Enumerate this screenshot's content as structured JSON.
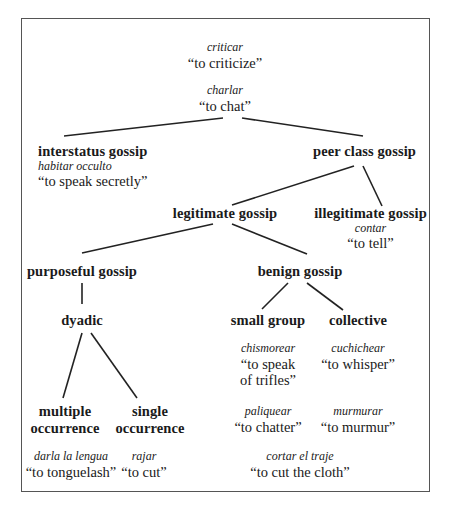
{
  "diagram": {
    "type": "tree",
    "title": "",
    "root_terms": [
      {
        "term": "criticar",
        "gloss": "“to criticize”"
      },
      {
        "term": "charlar",
        "gloss": "“to chat”"
      }
    ],
    "nodes": {
      "interstatus": {
        "label": "interstatus gossip",
        "term": "habitar occulto",
        "gloss": "“to speak secretly”"
      },
      "peer_class": {
        "label": "peer class gossip"
      },
      "legitimate": {
        "label": "legitimate gossip"
      },
      "illegitimate": {
        "label": "illegitimate gossip",
        "term": "contar",
        "gloss": "“to tell”"
      },
      "purposeful": {
        "label": "purposeful gossip"
      },
      "benign": {
        "label": "benign gossip"
      },
      "dyadic": {
        "label": "dyadic"
      },
      "small_group": {
        "label": "small group"
      },
      "collective": {
        "label": "collective"
      },
      "multiple": {
        "label_line1": "multiple",
        "label_line2": "occurrence"
      },
      "single": {
        "label_line1": "single",
        "label_line2": "occurrence"
      }
    },
    "terms": {
      "multiple": {
        "term": "darla la lengua",
        "gloss": "“to tonguelash”"
      },
      "single": {
        "term": "rajar",
        "gloss": "“to cut”"
      },
      "small_group_1": {
        "term": "chismorear",
        "gloss_line1": "“to speak",
        "gloss_line2": "of trifles”"
      },
      "small_group_2": {
        "term": "paliquear",
        "gloss": "“to chatter”"
      },
      "collective_1": {
        "term": "cuchichear",
        "gloss": "“to whisper”"
      },
      "collective_2": {
        "term": "murmurar",
        "gloss": "“to murmur”"
      },
      "benign_shared": {
        "term": "cortar el traje",
        "gloss": "“to cut the cloth”"
      }
    },
    "edges": [
      [
        "charlar",
        "interstatus gossip"
      ],
      [
        "charlar",
        "peer class gossip"
      ],
      [
        "peer class gossip",
        "legitimate gossip"
      ],
      [
        "peer class gossip",
        "illegitimate gossip"
      ],
      [
        "legitimate gossip",
        "purposeful gossip"
      ],
      [
        "legitimate gossip",
        "benign gossip"
      ],
      [
        "purposeful gossip",
        "dyadic"
      ],
      [
        "dyadic",
        "multiple occurrence"
      ],
      [
        "dyadic",
        "single occurrence"
      ],
      [
        "benign gossip",
        "small group"
      ],
      [
        "benign gossip",
        "collective"
      ]
    ],
    "colors": {
      "line": "#222222",
      "border": "#555555",
      "text": "#1a1a1a",
      "background": "#ffffff"
    }
  }
}
